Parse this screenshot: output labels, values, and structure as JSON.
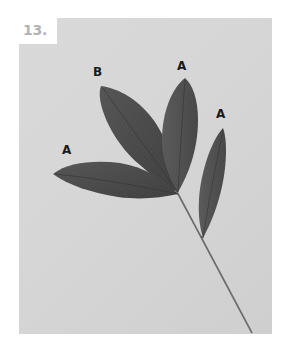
{
  "figure": {
    "step_number": "13.",
    "background_color": "#d8d8d8",
    "leaf_color": "#4a4a4a",
    "labels": [
      {
        "text": "B",
        "x": 93,
        "y": 66
      },
      {
        "text": "A",
        "x": 177,
        "y": 60
      },
      {
        "text": "A",
        "x": 216,
        "y": 108
      },
      {
        "text": "A",
        "x": 62,
        "y": 144
      }
    ]
  }
}
